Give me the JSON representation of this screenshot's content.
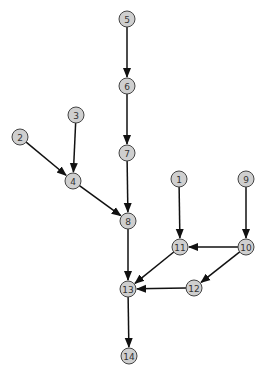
{
  "diagram": {
    "type": "directed-graph",
    "colors": {
      "node_fill": "#cfcfcf",
      "node_stroke": "#444444",
      "edge": "#111111",
      "label": "#333333",
      "background": "#ffffff"
    },
    "nodes": [
      {
        "id": "1",
        "label": "1",
        "x": 179,
        "y": 179
      },
      {
        "id": "2",
        "label": "2",
        "x": 20,
        "y": 137
      },
      {
        "id": "3",
        "label": "3",
        "x": 76,
        "y": 115
      },
      {
        "id": "4",
        "label": "4",
        "x": 73,
        "y": 181
      },
      {
        "id": "5",
        "label": "5",
        "x": 127,
        "y": 19
      },
      {
        "id": "6",
        "label": "6",
        "x": 127,
        "y": 86
      },
      {
        "id": "7",
        "label": "7",
        "x": 127,
        "y": 153
      },
      {
        "id": "8",
        "label": "8",
        "x": 128,
        "y": 221
      },
      {
        "id": "9",
        "label": "9",
        "x": 246,
        "y": 179
      },
      {
        "id": "10",
        "label": "10",
        "x": 246,
        "y": 247
      },
      {
        "id": "11",
        "label": "11",
        "x": 180,
        "y": 247
      },
      {
        "id": "12",
        "label": "12",
        "x": 194,
        "y": 288
      },
      {
        "id": "13",
        "label": "13",
        "x": 128,
        "y": 289
      },
      {
        "id": "14",
        "label": "14",
        "x": 129,
        "y": 356
      }
    ],
    "edges": [
      {
        "from": "5",
        "to": "6"
      },
      {
        "from": "6",
        "to": "7"
      },
      {
        "from": "7",
        "to": "8"
      },
      {
        "from": "3",
        "to": "4"
      },
      {
        "from": "2",
        "to": "4"
      },
      {
        "from": "4",
        "to": "8"
      },
      {
        "from": "8",
        "to": "13"
      },
      {
        "from": "1",
        "to": "11"
      },
      {
        "from": "9",
        "to": "10"
      },
      {
        "from": "10",
        "to": "11"
      },
      {
        "from": "10",
        "to": "12"
      },
      {
        "from": "11",
        "to": "13"
      },
      {
        "from": "12",
        "to": "13"
      },
      {
        "from": "13",
        "to": "14"
      }
    ],
    "node_radius": 8
  }
}
